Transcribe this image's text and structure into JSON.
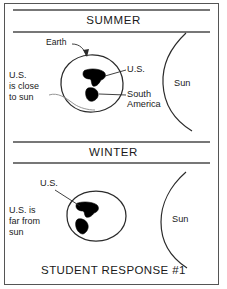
{
  "figure": {
    "caption": "STUDENT RESPONSE #1",
    "border_color": "#555555",
    "ink_color": "#1a1a1a",
    "landmass_fill": "#000000"
  },
  "sections": [
    {
      "key": "summer",
      "title": "SUMMER",
      "side_note_lines": [
        "U.S.",
        "is close",
        "to sun"
      ],
      "labels": [
        {
          "name": "earth",
          "text": "Earth"
        },
        {
          "name": "us",
          "text": "U.S."
        },
        {
          "name": "south-america-line1",
          "text": "South"
        },
        {
          "name": "south-america-line2",
          "text": "America"
        },
        {
          "name": "sun",
          "text": "Sun"
        }
      ]
    },
    {
      "key": "winter",
      "title": "WINTER",
      "side_note_lines": [
        "U.S. is",
        "far from",
        "sun"
      ],
      "labels": [
        {
          "name": "us",
          "text": "U.S."
        },
        {
          "name": "sun",
          "text": "Sun"
        }
      ]
    }
  ]
}
